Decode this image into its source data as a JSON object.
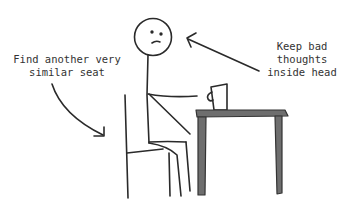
{
  "annotations": {
    "left": {
      "lines": [
        "Find another very",
        "similar seat"
      ]
    },
    "right": {
      "lines": [
        "Keep bad",
        "thoughts",
        "inside head"
      ]
    }
  },
  "figure": {
    "elements": [
      "stick-figure",
      "chair",
      "table",
      "cup",
      "arrow-to-chair",
      "arrow-to-head"
    ],
    "colors": {
      "ink": "#2a2a2a",
      "table_fill": "#6e6e6e",
      "table_stroke": "#333333",
      "background": "#ffffff"
    }
  }
}
